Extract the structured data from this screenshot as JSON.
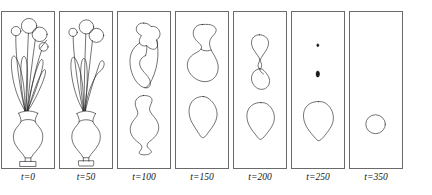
{
  "figure": {
    "type": "curve-evolution-sequence",
    "caption": "",
    "stroke_color": "#1a1a1a",
    "frame_color": "#6a6a6a",
    "background_color": "#ffffff",
    "panel_count": 7,
    "time_variable": "t"
  },
  "panels": [
    {
      "label": "t=0",
      "time_value": 0,
      "time_prefix": "t=",
      "description": "Flower bouquet in a vase: four round blossoms on thin stems, long tapered leaves, bulbous vase with flared rim and rectangular base",
      "shape_count": 9,
      "shapes": [
        {
          "name": "blossom-small-left",
          "kind": "circle",
          "cx": 13.5,
          "cy": 19.0,
          "r": 4.6
        },
        {
          "name": "blossom-large-top",
          "kind": "circle",
          "cx": 26.0,
          "cy": 13.8,
          "r": 7.4
        },
        {
          "name": "blossom-large-right",
          "kind": "circle",
          "cx": 36.0,
          "cy": 22.0,
          "r": 7.2
        },
        {
          "name": "blossom-small-right",
          "kind": "circle",
          "cx": 40.0,
          "cy": 34.5,
          "r": 4.3
        },
        {
          "name": "leaf-far-left",
          "kind": "leaf"
        },
        {
          "name": "leaf-left",
          "kind": "leaf"
        },
        {
          "name": "leaf-center",
          "kind": "leaf"
        },
        {
          "name": "leaf-right",
          "kind": "leaf"
        },
        {
          "name": "vase",
          "kind": "vase"
        }
      ]
    },
    {
      "label": "t=50",
      "time_value": 50,
      "time_prefix": "t=",
      "description": "Smoothed bouquet: thin stems have absorbed, blossoms rounder and merging, leaves thicker, vase rim softened",
      "shape_count": 7,
      "shapes": [
        {
          "name": "blossom-small-left",
          "kind": "circle",
          "cx": 12.5,
          "cy": 20.0,
          "r": 4.0
        },
        {
          "name": "blossom-large-top",
          "kind": "circle",
          "cx": 25.5,
          "cy": 14.5,
          "r": 7.0
        },
        {
          "name": "blossom-large-right",
          "kind": "circle",
          "cx": 35.0,
          "cy": 23.0,
          "r": 7.0
        },
        {
          "name": "leaf-left",
          "kind": "leaf"
        },
        {
          "name": "leaf-center",
          "kind": "leaf"
        },
        {
          "name": "leaf-right-hooked",
          "kind": "leaf"
        },
        {
          "name": "vase",
          "kind": "vase"
        }
      ]
    },
    {
      "label": "t=100",
      "time_value": 100,
      "time_prefix": "t=",
      "description": "Topology change: blossoms and leaves merged into one lobed upper blob; vase separated into a rounded lower blob with small foot",
      "shape_count": 2,
      "shapes": [
        {
          "name": "upper-merged-blob",
          "kind": "blob"
        },
        {
          "name": "lower-vase-blob",
          "kind": "blob"
        }
      ]
    },
    {
      "label": "t=150",
      "time_value": 150,
      "time_prefix": "t=",
      "description": "Upper blob simplified into an S-shaped dumbbell; lower blob now a convex rounded teardrop",
      "shape_count": 2,
      "shapes": [
        {
          "name": "upper-s-blob",
          "kind": "blob"
        },
        {
          "name": "lower-rounded-blob",
          "kind": "blob"
        }
      ]
    },
    {
      "label": "t=200",
      "time_value": 200,
      "time_prefix": "t=",
      "description": "Upper shape pinching into two small teardrops joined at a neck; lower shape a convex rounded polygon",
      "shape_count": 3,
      "shapes": [
        {
          "name": "upper-teardrop",
          "kind": "blob"
        },
        {
          "name": "middle-teardrop",
          "kind": "blob"
        },
        {
          "name": "lower-rounded-blob",
          "kind": "blob"
        }
      ]
    },
    {
      "label": "t=250",
      "time_value": 250,
      "time_prefix": "t=",
      "description": "Two upper pieces shrunk to tiny dots; lower shape remains a large rounded convex curve",
      "shape_count": 3,
      "shapes": [
        {
          "name": "upper-dot",
          "kind": "dot",
          "cx": 25.0,
          "cy": 33.0,
          "r": 1.1
        },
        {
          "name": "middle-dot",
          "kind": "dot",
          "cx": 25.0,
          "cy": 62.0,
          "r": 2.0
        },
        {
          "name": "lower-rounded-blob",
          "kind": "blob"
        }
      ]
    },
    {
      "label": "t=350",
      "time_value": 350,
      "time_prefix": "t=",
      "description": "Only a single shrinking circle remains",
      "shape_count": 1,
      "shapes": [
        {
          "name": "final-circle",
          "kind": "circle",
          "cx": 25.0,
          "cy": 112.0,
          "r": 9.5
        }
      ]
    }
  ]
}
